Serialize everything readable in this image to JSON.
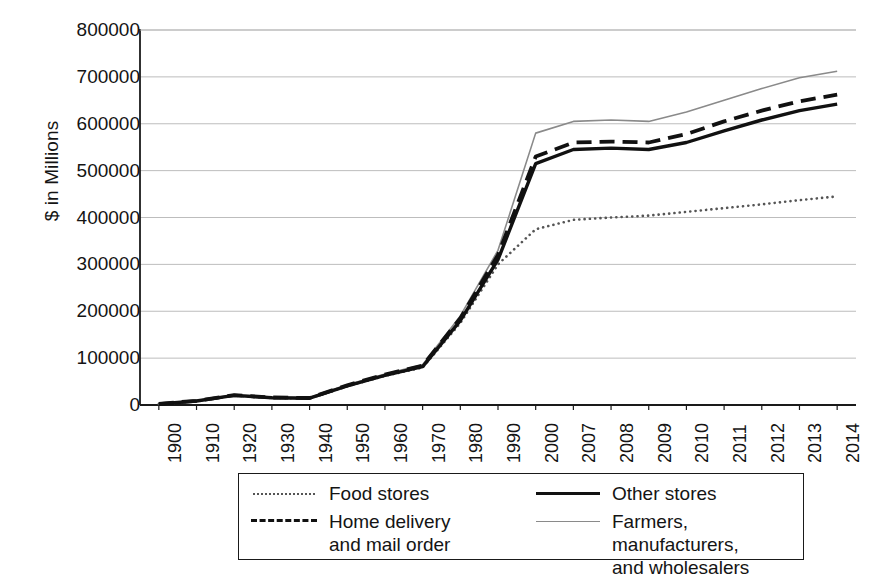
{
  "chart_data": {
    "type": "line",
    "title": "",
    "xlabel": "",
    "ylabel": "$ in Millions",
    "ylim": [
      0,
      800000
    ],
    "ytick_labels": [
      "800000",
      "700000",
      "600000",
      "500000",
      "400000",
      "300000",
      "200000",
      "100000",
      "0"
    ],
    "ytick_values": [
      800000,
      700000,
      600000,
      500000,
      400000,
      300000,
      200000,
      100000,
      0
    ],
    "grid": true,
    "legend_position": "below-center",
    "categories": [
      "1900",
      "1910",
      "1920",
      "1930",
      "1940",
      "1950",
      "1960",
      "1970",
      "1980",
      "1990",
      "2000",
      "2007",
      "2008",
      "2009",
      "2010",
      "2011",
      "2012",
      "2013",
      "2014"
    ],
    "series": [
      {
        "name": "Food stores",
        "style": "dotted",
        "color": "#555555",
        "values": [
          2000,
          8000,
          20000,
          15000,
          14000,
          40000,
          62000,
          80000,
          175000,
          300000,
          375000,
          395000,
          400000,
          404000,
          412000,
          420000,
          428000,
          437000,
          445000
        ]
      },
      {
        "name": "Home delivery\nand mail order",
        "style": "dashed",
        "color": "#111111",
        "values": [
          2500,
          9000,
          21000,
          16000,
          15000,
          42000,
          65000,
          84000,
          185000,
          320000,
          530000,
          560000,
          562000,
          560000,
          578000,
          605000,
          628000,
          648000,
          662000
        ]
      },
      {
        "name": "Other stores",
        "style": "solid-thick",
        "color": "#111111",
        "values": [
          2200,
          8500,
          20500,
          15500,
          14500,
          41000,
          63000,
          82000,
          180000,
          310000,
          515000,
          545000,
          548000,
          545000,
          560000,
          585000,
          608000,
          628000,
          642000
        ]
      },
      {
        "name": "Farmers, manufacturers,\nand wholesalers",
        "style": "solid-thin",
        "color": "#8a8a8a",
        "values": [
          2800,
          9500,
          22000,
          17000,
          16000,
          43000,
          66000,
          86000,
          190000,
          330000,
          580000,
          605000,
          608000,
          605000,
          625000,
          650000,
          675000,
          698000,
          712000
        ]
      }
    ]
  },
  "legend": {
    "items": [
      {
        "label": "Food stores",
        "style": "dotted"
      },
      {
        "label": "Other stores",
        "style": "solid-thick"
      },
      {
        "label": "Home delivery\nand mail order",
        "style": "dashed"
      },
      {
        "label": "Farmers, manufacturers,\nand wholesalers",
        "style": "solid-thin"
      }
    ]
  },
  "axes": {
    "y_title": "$ in Millions"
  }
}
